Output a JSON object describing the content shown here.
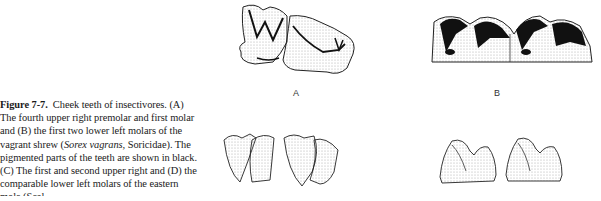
{
  "caption": {
    "figure_label": "Figure 7-7.",
    "title": "Cheek teeth of insectivores. (A)",
    "lines": [
      "The fourth upper right premolar and first molar",
      "and (B) the first two lower left molars of the",
      "vagrant shrew (Sorex vagrans, Soricidae). The",
      "pigmented parts of the teeth are shown in black.",
      "(C) The first and second upper right and (D) the",
      "comparable lower left molars of the eastern",
      "mole (Scal..."
    ]
  },
  "panels": [
    {
      "id": "A",
      "label": "A",
      "description": "Fourth upper right premolar and first molar, vagrant shrew"
    },
    {
      "id": "B",
      "label": "B",
      "description": "First two lower left molars with pigmented (black) tips, vagrant shrew"
    },
    {
      "id": "C",
      "label": "",
      "description": "First and second upper right molars, eastern mole"
    },
    {
      "id": "D",
      "label": "",
      "description": "Comparable lower left molars, eastern mole"
    }
  ],
  "colors": {
    "ink": "#1a1a1a",
    "pigment": "#111111",
    "shade": "#bdbdbd",
    "paper": "#ffffff"
  }
}
